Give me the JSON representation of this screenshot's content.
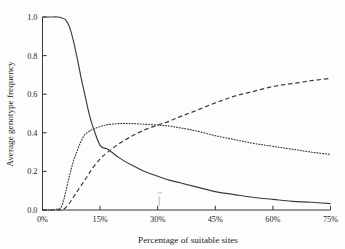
{
  "figure": {
    "background_color": "#fdfdfd",
    "ink_color": "#3b3b3b"
  },
  "chart_data": {
    "type": "line",
    "title": "",
    "subtitle": "",
    "xlabel": "Percentage of suitable sites",
    "ylabel": "Average genotype frequency",
    "xlim": [
      0,
      75
    ],
    "ylim": [
      0.0,
      1.0
    ],
    "x_tick_labels": [
      "0%",
      "15%",
      "30%",
      "45%",
      "60%",
      "75%"
    ],
    "x_tick_values": [
      0,
      15,
      30,
      45,
      60,
      75
    ],
    "y_tick_labels": [
      "0.0",
      "0.2",
      "0.4",
      "0.6",
      "0.8",
      "1.0"
    ],
    "y_tick_values": [
      0.0,
      0.2,
      0.4,
      0.6,
      0.8,
      1.0
    ],
    "grid": false,
    "legend": false,
    "legend_position": "none",
    "spines": [
      "left",
      "bottom"
    ],
    "tick_direction": "in",
    "x": [
      0,
      2,
      4,
      5,
      6,
      7,
      8,
      9,
      10,
      11,
      12,
      13,
      15,
      17,
      20,
      23,
      26,
      30,
      33,
      36,
      40,
      45,
      50,
      55,
      60,
      65,
      70,
      75
    ],
    "series": [
      {
        "name": "solid curve",
        "style": "solid",
        "values": [
          1.0,
          1.0,
          1.0,
          0.995,
          0.985,
          0.95,
          0.88,
          0.79,
          0.69,
          0.6,
          0.51,
          0.44,
          0.335,
          0.315,
          0.27,
          0.235,
          0.205,
          0.175,
          0.155,
          0.14,
          0.12,
          0.095,
          0.08,
          0.065,
          0.055,
          0.045,
          0.04,
          0.033
        ]
      },
      {
        "name": "dotted curve",
        "style": "dotted",
        "values": [
          0.0,
          0.0,
          0.005,
          0.02,
          0.09,
          0.175,
          0.25,
          0.305,
          0.355,
          0.39,
          0.405,
          0.418,
          0.432,
          0.442,
          0.448,
          0.448,
          0.445,
          0.44,
          0.435,
          0.425,
          0.41,
          0.385,
          0.365,
          0.345,
          0.33,
          0.315,
          0.3,
          0.288
        ]
      },
      {
        "name": "dashed curve",
        "style": "dashed",
        "values": [
          0.0,
          0.0,
          0.0,
          0.0,
          0.012,
          0.035,
          0.065,
          0.095,
          0.125,
          0.155,
          0.185,
          0.215,
          0.265,
          0.3,
          0.345,
          0.38,
          0.41,
          0.44,
          0.46,
          0.485,
          0.515,
          0.555,
          0.59,
          0.615,
          0.64,
          0.655,
          0.67,
          0.682
        ]
      }
    ]
  }
}
